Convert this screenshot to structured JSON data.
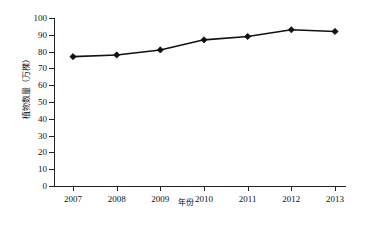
{
  "chart_data": {
    "type": "line",
    "title": "",
    "xlabel": "年份",
    "ylabel": "植物数量（万棵）",
    "categories": [
      "2007",
      "2008",
      "2009",
      "2010",
      "2011",
      "2012",
      "2013"
    ],
    "values": [
      77,
      78,
      81,
      87,
      89,
      93,
      92
    ],
    "series": [
      {
        "name": "植物数量",
        "values": [
          77,
          78,
          81,
          87,
          89,
          93,
          92
        ]
      }
    ],
    "ylim": [
      0,
      100
    ],
    "yticks": [
      "0",
      "10",
      "20",
      "30",
      "40",
      "50",
      "60",
      "70",
      "80",
      "90",
      "100"
    ],
    "ytick_values": [
      0,
      10,
      20,
      30,
      40,
      50,
      60,
      70,
      80,
      90,
      100
    ],
    "grid": false,
    "legend": false,
    "legend_position": "none",
    "marker": "diamond",
    "line_color": "#111111",
    "marker_color": "#111111",
    "background_color": "#ffffff"
  }
}
